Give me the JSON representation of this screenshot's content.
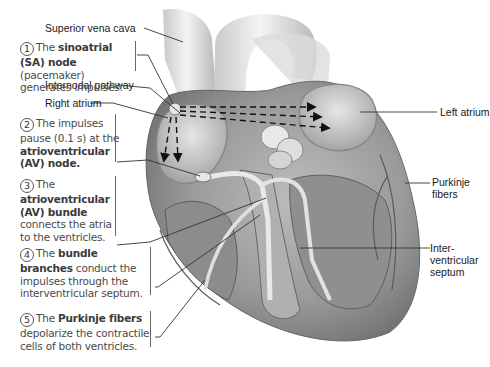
{
  "labels": {
    "superior_vena_cava": "Superior vena cava",
    "internodal_pathway": "Internodal pathway",
    "right_atrium": "Right atrium",
    "left_atrium": "Left atrium",
    "purkinje_fibers_line1": "Purkinje",
    "purkinje_fibers_line2": "fibers",
    "interventricular_line1": "Inter-",
    "interventricular_line2": "ventricular",
    "interventricular_line3": "septum"
  },
  "steps": [
    {
      "number": "1",
      "lead": "The ",
      "bold": "sinoatrial (SA) node",
      "rest": " (pacemaker) generates impulses."
    },
    {
      "number": "2",
      "lead": "The impulses pause (0.1 s) at the ",
      "bold": "atrioventricular (AV) node.",
      "rest": ""
    },
    {
      "number": "3",
      "lead": "The ",
      "bold": "atrioventricular (AV) bundle",
      "rest": " connects the atria to the ventricles."
    },
    {
      "number": "4",
      "lead": "The ",
      "bold": "bundle branches",
      "rest": " conduct the impulses through the interventricular septum."
    },
    {
      "number": "5",
      "lead": "The ",
      "bold": "Purkinje fibers",
      "rest": " depolarize the contractile cells of both ventricles."
    }
  ],
  "colors": {
    "tissue_dark": "#6e6e6e",
    "tissue_mid": "#a8a8a8",
    "tissue_light": "#d9d9d9",
    "leader_line": "#333333",
    "text": "#4a4a4a"
  }
}
